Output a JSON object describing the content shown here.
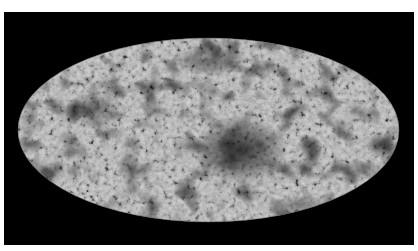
{
  "image": {
    "subject": "full-sky map in elliptical (Mollweide) projection",
    "background_color": "#ffffff",
    "frame_color": "#000000",
    "map_base_color": "#8a8a8a",
    "cold_spot_color": "#0a0a0a",
    "hot_spot_color": "#e8e8e8"
  }
}
